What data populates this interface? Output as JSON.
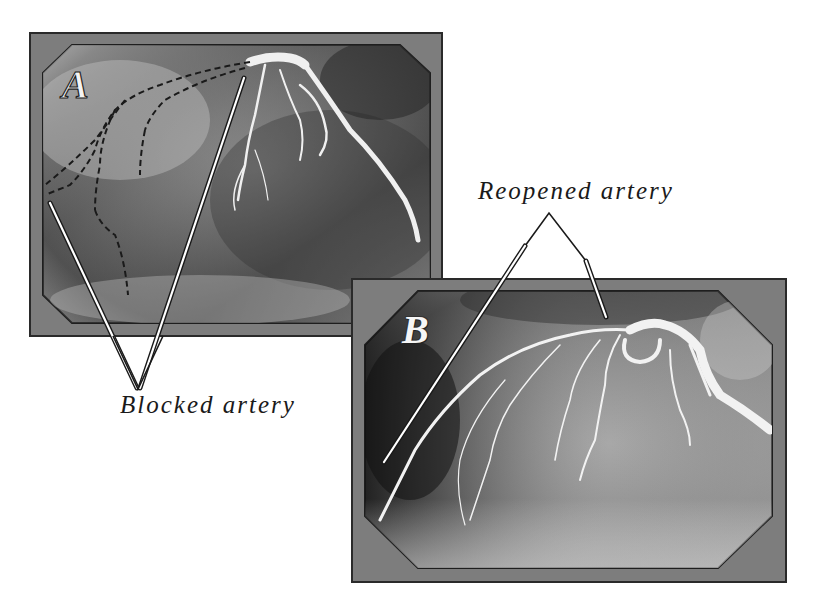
{
  "figure": {
    "panels": [
      {
        "id": "A",
        "letter": "A",
        "state": "blocked",
        "frame_color": "#7a7a7a",
        "image_tone": "dark grayscale angiogram with dashed outlines of missing vessels"
      },
      {
        "id": "B",
        "letter": "B",
        "state": "reopened",
        "frame_color": "#7a7a7a",
        "image_tone": "grayscale angiogram with visible, reperfused vessels"
      }
    ],
    "callouts": {
      "blocked": {
        "label": "Blocked artery",
        "points_to_panel": "A",
        "pointer_count": 2
      },
      "reopened": {
        "label": "Reopened artery",
        "points_to_panel": "B",
        "pointer_count": 2
      }
    }
  },
  "colors": {
    "background": "#ffffff",
    "frame": "#7d7d7d",
    "frame_border": "#2a2a2a",
    "text": "#1a1a1a",
    "vessel": "#f2f2f2",
    "pointer_fill": "#ffffff",
    "pointer_stroke": "#1a1a1a"
  }
}
